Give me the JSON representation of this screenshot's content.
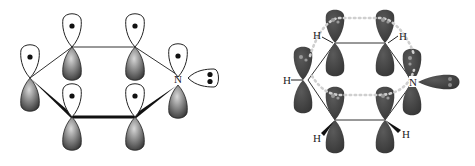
{
  "figure": {
    "left_diagram": {
      "description": "Pyridine p-orbital (valence bond) picture, one electron per p orbital and lone pair on nitrogen",
      "atom_label": "N",
      "lone_pair_electrons": 2,
      "p_orbital_electrons": 6
    },
    "right_diagram": {
      "description": "Pyridine pi-system with delocalized ring (dotted) and hydrogen substituents",
      "atom_label": "N",
      "hydrogen_labels": [
        "H",
        "H",
        "H",
        "H",
        "H"
      ]
    }
  },
  "colors": {
    "outline": "#222222",
    "shaded_lobe_dark": "#3a3a3a",
    "shaded_lobe_light": "#cfcfcf",
    "right_lobe": "#444444",
    "dotted_ring": "#c8c8c8",
    "background": "#ffffff"
  }
}
